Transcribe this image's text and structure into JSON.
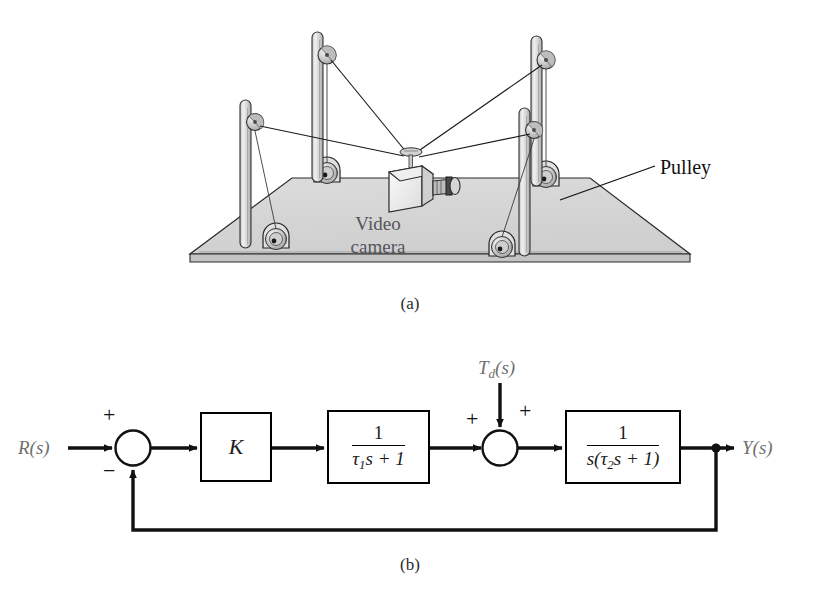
{
  "figure": {
    "panel_a": {
      "caption": "(a)",
      "labels": {
        "pulley": "Pulley",
        "video_camera": "Video\ncamera"
      },
      "illustration": {
        "name": "cable-suspended-video-camera-rig",
        "base_plate_color": "#d6d6d6",
        "pole_color": "#e2e2e2",
        "line_color": "#1a1a1a",
        "pole_count": 4,
        "pulley_count_top": 4,
        "pulley_count_base": 4,
        "cable_count": 4
      }
    },
    "panel_b": {
      "caption": "(b)",
      "input_label": "R(s)",
      "input_label_base": "R",
      "input_label_arg": "(s)",
      "output_label": "Y(s)",
      "output_label_base": "Y",
      "output_label_arg": "(s)",
      "disturbance_label_base": "T",
      "disturbance_label_sub": "d",
      "disturbance_label_arg": "(s)",
      "signs": {
        "summer1_plus": "+",
        "summer1_minus": "−",
        "summer2_left_plus": "+",
        "summer2_top_plus": "+"
      },
      "blocks": [
        {
          "name": "gain-block",
          "text": "K"
        },
        {
          "name": "first-order-lag-block",
          "numerator": "1",
          "denominator_tau": "τ",
          "denominator_sub": "1",
          "denominator_rest": "s + 1"
        },
        {
          "name": "integrator-lag-block",
          "numerator": "1",
          "denominator_lead": "s(",
          "denominator_tau": "τ",
          "denominator_sub": "2",
          "denominator_rest": "s + 1)"
        }
      ]
    }
  },
  "colors": {
    "ink": "#111111",
    "label_gray": "#6f6f6f",
    "plate_fill": "#d6d6d6",
    "plate_edge": "#1a1a1a",
    "pole_fill": "#e6e6e6"
  }
}
